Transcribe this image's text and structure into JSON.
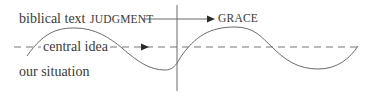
{
  "diagram": {
    "labels": {
      "biblical_text": "biblical text",
      "central_idea": "central idea",
      "our_situation": "our situation",
      "judgment": "JUDGMENT",
      "grace": "GRACE"
    },
    "colors": {
      "stroke": "#6b6b6b",
      "text": "#3a3a3a",
      "background": "#ffffff"
    }
  }
}
